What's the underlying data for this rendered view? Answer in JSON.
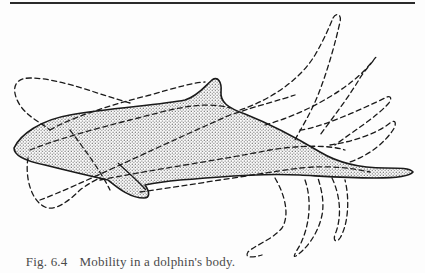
{
  "figure": {
    "label": "Fig. 6.4",
    "caption": "Mobility in a dolphin's body.",
    "subject": "dolphin",
    "illustration": {
      "body_style": "solid outline with stippled dot fill",
      "alternate_positions_style": "dashed outlines",
      "alternate_positions_count": 8
    },
    "colors": {
      "ink": "#1a1a1a",
      "stipple": "#3a3a3a",
      "paper": "#fdfdfd",
      "caption_text": "#4a4a4a"
    }
  }
}
